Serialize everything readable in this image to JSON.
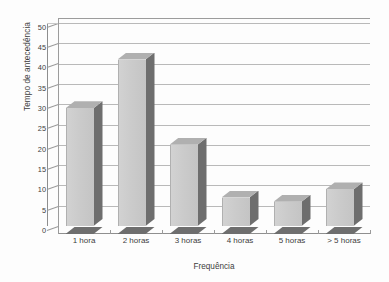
{
  "chart_data": {
    "type": "bar",
    "title": "",
    "subtitle": "",
    "xlabel": "Frequência",
    "ylabel": "Tempo de antecedência",
    "categories": [
      "1 hora",
      "2 horas",
      "3 horas",
      "4 horas",
      "5 horas",
      "> 5 horas"
    ],
    "values": [
      29,
      41,
      20,
      7,
      6,
      9
    ],
    "ylim": [
      0,
      50
    ],
    "ytick_labels": [
      "0",
      "5",
      "10",
      "15",
      "20",
      "25",
      "30",
      "35",
      "40",
      "45",
      "50"
    ],
    "ytick_values": [
      0,
      5,
      10,
      15,
      20,
      25,
      30,
      35,
      40,
      45,
      50
    ],
    "ytick_step": 5,
    "grid": true,
    "grid_axis": "y",
    "legend": false,
    "legend_position": "none",
    "style": "3d-bar",
    "series": [
      {
        "name": "Tempo de antecedência",
        "values": [
          29,
          41,
          20,
          7,
          6,
          9
        ]
      }
    ],
    "annotations": [],
    "colors": {
      "bar_front": "#cbcbcb",
      "bar_side": "#6e6e6e",
      "bar_top": "#b4b4b4",
      "gridline": "#b9b9b9",
      "axis": "#9c9c9c",
      "text": "#3d3d3d",
      "background": "#fdfdfd"
    }
  }
}
